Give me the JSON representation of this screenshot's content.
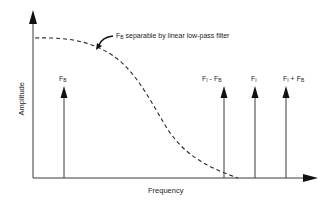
{
  "diagram": {
    "type": "spectrum-sketch",
    "axes": {
      "x_label": "Frequency",
      "y_label": "Amplitude"
    },
    "annotation": {
      "prefix": "F",
      "prefix_sub": "B",
      "text": " separable by linear low-pass filter"
    },
    "spectral_lines": [
      {
        "id": "fb",
        "label_main": "F",
        "label_sub": "B",
        "label_rest": ""
      },
      {
        "id": "fi-minus-fb",
        "label_main": "F",
        "label_sub": "I",
        "label_rest": " - F",
        "label_sub2": "B"
      },
      {
        "id": "fi",
        "label_main": "F",
        "label_sub": "I",
        "label_rest": ""
      },
      {
        "id": "fi-plus-fb",
        "label_main": "F",
        "label_sub": "I",
        "label_rest": " + F",
        "label_sub2": "B"
      }
    ],
    "curve": {
      "style": "dashed",
      "description": "low-pass filter response"
    },
    "colors": {
      "line": "#2a2a2a",
      "background": "#ffffff"
    }
  }
}
